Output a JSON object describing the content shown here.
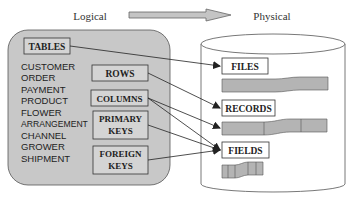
{
  "header": {
    "left_label": "Logical",
    "right_label": "Physical"
  },
  "logical": {
    "tables_label": "TABLES",
    "table_names": [
      "CUSTOMER",
      "ORDER",
      "PAYMENT",
      "PRODUCT",
      "FLOWER",
      "ARRANGEMENT",
      "CHANNEL",
      "GROWER",
      "SHIPMENT"
    ],
    "rows_label": "ROWS",
    "columns_label": "COLUMNS",
    "primary_keys_label_1": "PRIMARY",
    "primary_keys_label_2": "KEYS",
    "foreign_keys_label_1": "FOREIGN",
    "foreign_keys_label_2": "KEYS"
  },
  "physical": {
    "files_label": "FILES",
    "records_label": "RECORDS",
    "fields_label": "FIELDS"
  },
  "mappings": [
    {
      "from": "TABLES",
      "to": "FILES"
    },
    {
      "from": "ROWS",
      "to": "RECORDS"
    },
    {
      "from": "COLUMNS",
      "to": "RECORDS"
    },
    {
      "from": "COLUMNS",
      "to": "FIELDS"
    },
    {
      "from": "PRIMARY KEYS",
      "to": "FIELDS"
    },
    {
      "from": "FOREIGN KEYS",
      "to": "FIELDS"
    }
  ],
  "colors": {
    "panel_fill": "#c8c8c8",
    "bar_fill": "#b4b4b4",
    "line": "#333333",
    "box_fill": "#ffffff"
  }
}
